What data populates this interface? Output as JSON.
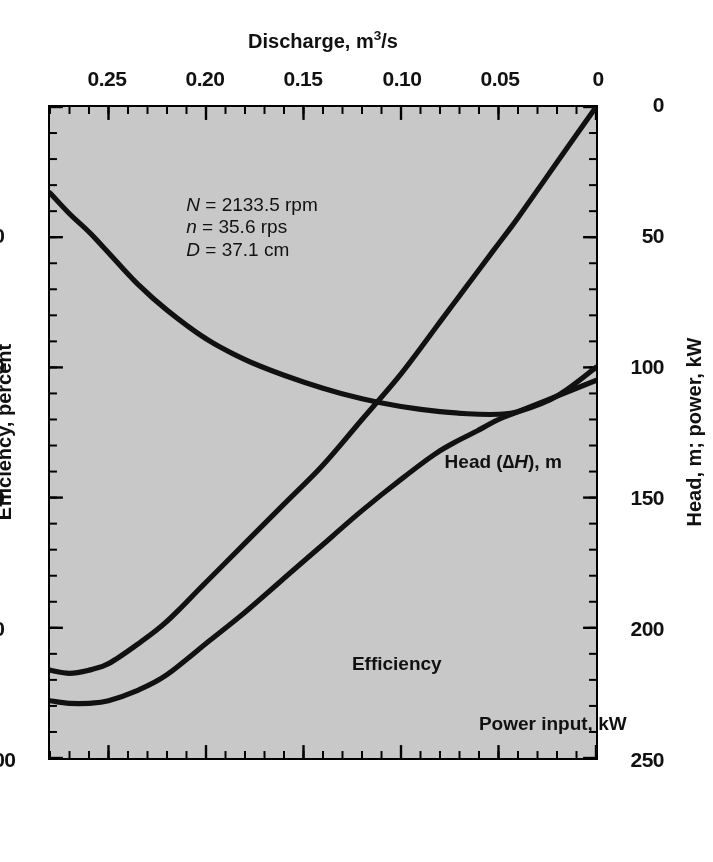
{
  "figure": {
    "orientation_note": "rotated-180",
    "background_color": "#ffffff",
    "plot_background_color": "#c8c8c8",
    "curve_color": "#111111"
  },
  "axes": {
    "x": {
      "title_main": "Discharge, m",
      "title_exponent": "3",
      "title_tail": "/s",
      "min": 0,
      "max": 0.28,
      "ticks": [
        "0",
        "0.05",
        "0.10",
        "0.15",
        "0.20",
        "0.25"
      ],
      "tick_values": [
        0,
        0.05,
        0.1,
        0.15,
        0.2,
        0.25
      ],
      "minor_tick_step": 0.01
    },
    "y_left": {
      "title": "Head, m; power, kW",
      "min": 0,
      "max": 250,
      "ticks": [
        "0",
        "50",
        "100",
        "150",
        "200",
        "250"
      ],
      "tick_values": [
        0,
        50,
        100,
        150,
        200,
        250
      ],
      "minor_tick_step": 10
    },
    "y_right": {
      "title": "Efficiency, percent",
      "min": 0,
      "max": 100,
      "ticks": [
        "0",
        "20",
        "40",
        "60",
        "80",
        "100"
      ],
      "tick_values": [
        0,
        20,
        40,
        60,
        80,
        100
      ],
      "minor_tick_step": 4
    }
  },
  "annotations": {
    "efficiency_label": "Efficiency",
    "power_label": "Power input, kW",
    "head_label_pre": "Head (",
    "head_label_delta": "∆",
    "head_label_var": "H",
    "head_label_post": "), m",
    "params": {
      "line1_sym": "N",
      "line1_val": " = 2133.5 rpm",
      "line2_sym": "n",
      "line2_val": " = 35.6 rps",
      "line3_sym": "D",
      "line3_val": " = 37.1 cm"
    }
  },
  "chart_data": {
    "type": "line",
    "title": "",
    "subtitle": "",
    "xlabel": "Discharge, m3/s",
    "ylabel": "Head, m; power, kW",
    "y2label": "Efficiency, percent",
    "xlim": [
      0,
      0.28
    ],
    "ylim": [
      0,
      250
    ],
    "y2lim": [
      0,
      100
    ],
    "grid": false,
    "legend": "in-plot curve labels",
    "xticks": [
      0,
      0.05,
      0.1,
      0.15,
      0.2,
      0.25
    ],
    "yticks": [
      0,
      50,
      100,
      150,
      200,
      250
    ],
    "y2ticks": [
      0,
      20,
      40,
      60,
      80,
      100
    ],
    "x": [
      0,
      0.02,
      0.04,
      0.05,
      0.06,
      0.08,
      0.1,
      0.12,
      0.14,
      0.16,
      0.18,
      0.2,
      0.22,
      0.235,
      0.25,
      0.26,
      0.27,
      0.28
    ],
    "series": [
      {
        "name": "Head (∆H), m",
        "axis": "left",
        "units": "m",
        "values": [
          100,
          111,
          117,
          118,
          118,
          117,
          115,
          112,
          108,
          103,
          97,
          89,
          78,
          68,
          56,
          48,
          41,
          33
        ]
      },
      {
        "name": "Power input, kW",
        "axis": "left",
        "units": "kW",
        "values": [
          105,
          111,
          117,
          120,
          124,
          132,
          143,
          155,
          168,
          181,
          194,
          206,
          218,
          224,
          228,
          229,
          229,
          228
        ]
      },
      {
        "name": "Efficiency",
        "axis": "right",
        "units": "percent",
        "values": [
          0,
          8.5,
          17,
          21,
          25,
          33,
          41,
          48,
          55,
          61,
          67,
          73,
          79,
          82.5,
          85.5,
          86.5,
          87,
          86.5
        ]
      }
    ],
    "notes": [
      "N = 2133.5 rpm",
      "n = 35.6 rps",
      "D = 37.1 cm"
    ]
  }
}
